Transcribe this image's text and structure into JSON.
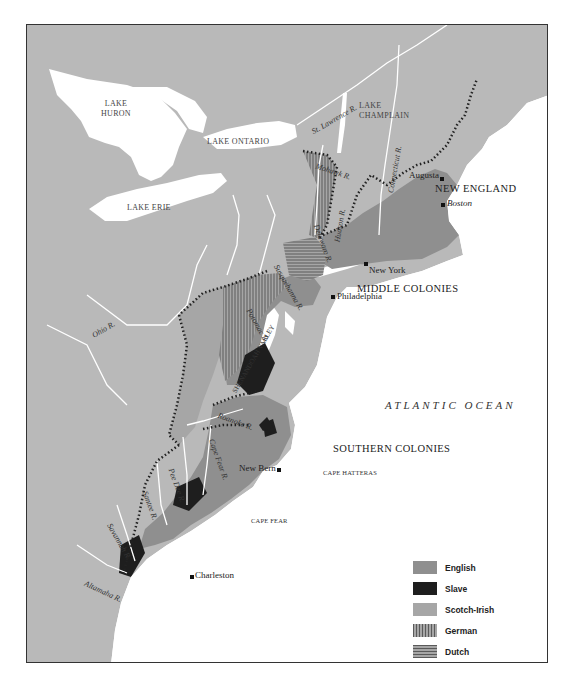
{
  "map": {
    "colors": {
      "land": "#b9b9b9",
      "water": "#ffffff",
      "english": "#8f8f8f",
      "slave": "#1e1e1e",
      "scotch_irish": "#a6a6a6",
      "german_hatch": "#6a6a6a",
      "dutch_hatch": "#6a6a6a",
      "frontier": "#222222"
    },
    "lakes": {
      "huron": "LAKE\nHURON",
      "ontario": "LAKE ONTARIO",
      "erie": "LAKE ERIE",
      "champlain": "LAKE\nCHAMPLAIN"
    },
    "regions": {
      "new_england": "NEW ENGLAND",
      "middle": "MIDDLE COLONIES",
      "southern": "SOUTHERN COLONIES",
      "shenandoah": "SHENANDOAH VALLEY"
    },
    "ocean": "ATLANTIC OCEAN",
    "cities": {
      "augusta": "Augusta",
      "boston": "Boston",
      "new_york": "New York",
      "philadelphia": "Philadelphia",
      "new_bern": "New Bern",
      "charleston": "Charleston"
    },
    "capes": {
      "hatteras": "CAPE HATTERAS",
      "fear": "CAPE FEAR"
    },
    "rivers": {
      "st_lawrence": "St. Lawrence R.",
      "connecticut": "Connecticut R.",
      "mohawk": "Mohawk R.",
      "hudson": "Hudson R.",
      "delaware": "Delaware R.",
      "susquehanna": "Susquehanna R.",
      "potomac": "Potomac R.",
      "ohio": "Ohio R.",
      "roanoke": "Roanoke R.",
      "cape_fear": "Cape Fear R.",
      "pee_dee": "Pee Dee R.",
      "santee": "Santee R.",
      "savannah": "Savannah R.",
      "altamaha": "Altamaha R."
    }
  },
  "legend": {
    "items": [
      {
        "label": "English",
        "key": "english"
      },
      {
        "label": "Slave",
        "key": "slave"
      },
      {
        "label": "Scotch-Irish",
        "key": "scotch_irish"
      },
      {
        "label": "German",
        "key": "german"
      },
      {
        "label": "Dutch",
        "key": "dutch"
      }
    ],
    "frontier_label": "Settlement Frontier"
  }
}
